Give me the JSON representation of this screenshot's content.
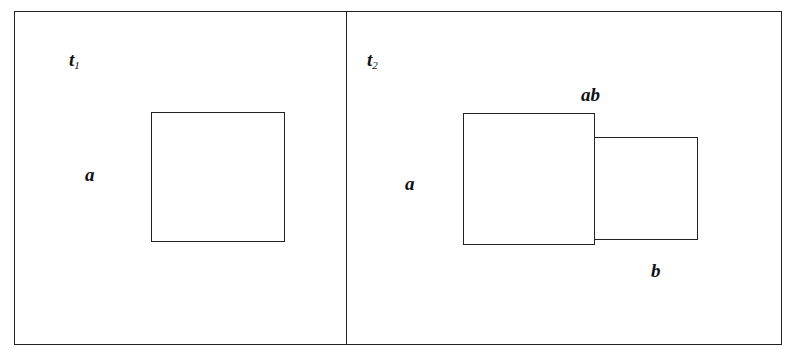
{
  "panels": [
    {
      "time_label": "t",
      "time_sub": "1",
      "region_labels": [
        "a"
      ],
      "shapes": [
        {
          "name": "square-a",
          "x": 151,
          "y": 112,
          "w": 134,
          "h": 130
        }
      ]
    },
    {
      "time_label": "t",
      "time_sub": "2",
      "region_labels": [
        "a",
        "ab",
        "b"
      ],
      "shapes": [
        {
          "name": "square-a",
          "x": 463,
          "y": 113,
          "w": 132,
          "h": 132
        },
        {
          "name": "square-b",
          "x": 594,
          "y": 137,
          "w": 104,
          "h": 103
        }
      ]
    }
  ],
  "colors": {
    "line": "#222222",
    "background": "#ffffff"
  }
}
